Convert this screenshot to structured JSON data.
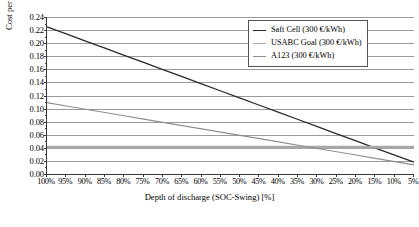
{
  "chart_data": {
    "type": "line",
    "title": "",
    "xlabel": "Depth of discharge (SOC-Swing) [%]",
    "ylabel": "Cost per KWh discharge [€/KWh]",
    "x": [
      100,
      95,
      90,
      85,
      80,
      75,
      70,
      65,
      60,
      55,
      50,
      45,
      40,
      35,
      30,
      25,
      20,
      15,
      10,
      5
    ],
    "categories": [
      "100%",
      "95%",
      "90%",
      "85%",
      "80%",
      "75%",
      "70%",
      "65%",
      "60%",
      "55%",
      "50%",
      "45%",
      "40%",
      "35%",
      "30%",
      "25%",
      "20%",
      "15%",
      "10%",
      "5%"
    ],
    "xlim": [
      100,
      5
    ],
    "ylim": [
      0.0,
      0.24
    ],
    "yticks": [
      "0.00",
      "0.02",
      "0.04",
      "0.06",
      "0.08",
      "0.10",
      "0.12",
      "0.14",
      "0.16",
      "0.18",
      "0.20",
      "0.22",
      "0.24"
    ],
    "ytick_values": [
      0.0,
      0.02,
      0.04,
      0.06,
      0.08,
      0.1,
      0.12,
      0.14,
      0.16,
      0.18,
      0.2,
      0.22,
      0.24
    ],
    "grid": "horizontal",
    "legend_position": "top-right",
    "series": [
      {
        "name": "Saft Cell (300 €/kWh)",
        "color": "#2b2b2b",
        "width": 1.3,
        "values": [
          0.225,
          0.2141,
          0.2032,
          0.1923,
          0.1814,
          0.1705,
          0.1596,
          0.1487,
          0.1378,
          0.1269,
          0.116,
          0.1051,
          0.0942,
          0.0833,
          0.0724,
          0.0615,
          0.0506,
          0.0397,
          0.0288,
          0.018
        ]
      },
      {
        "name": "USABC Goal (300 €/kWh)",
        "color": "#a8a8a8",
        "width": 3.0,
        "values": [
          0.041,
          0.041,
          0.041,
          0.041,
          0.041,
          0.041,
          0.041,
          0.041,
          0.041,
          0.041,
          0.041,
          0.041,
          0.041,
          0.041,
          0.041,
          0.041,
          0.041,
          0.041,
          0.041,
          0.041
        ]
      },
      {
        "name": "A123 (300 €/kWh)",
        "color": "#8f8f8f",
        "width": 1.2,
        "values": [
          0.109,
          0.104,
          0.099,
          0.094,
          0.089,
          0.084,
          0.079,
          0.074,
          0.069,
          0.064,
          0.059,
          0.054,
          0.049,
          0.044,
          0.039,
          0.034,
          0.029,
          0.024,
          0.019,
          0.014
        ]
      }
    ]
  },
  "axes": {
    "x_title": "Depth of discharge (SOC-Swing) [%]",
    "y_title": "Cost per KWh discharge [€/KWh]"
  },
  "legend": {
    "entries": [
      {
        "label": "Saft Cell (300 €/kWh)",
        "color": "#2b2b2b"
      },
      {
        "label": "USABC Goal (300 €/kWh)",
        "color": "#a8a8a8"
      },
      {
        "label": "A123 (300 €/kWh)",
        "color": "#8f8f8f"
      }
    ]
  },
  "colors": {
    "grid": "#9a9a9a",
    "axis": "#3a3a3a",
    "background": "#ffffff"
  }
}
